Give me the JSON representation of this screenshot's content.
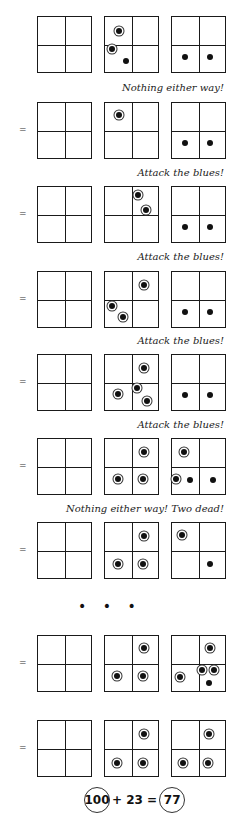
{
  "diagram": {
    "columns_x": [
      37,
      104,
      171
    ],
    "rows": [
      {
        "y": 16,
        "equals": false,
        "grids": [
          [],
          [
            {
              "x": 0.27,
              "y": 0.26,
              "type": "ringed"
            },
            {
              "x": 0.14,
              "y": 0.58,
              "type": "ringed"
            },
            {
              "x": 0.4,
              "y": 0.8,
              "type": "plain"
            }
          ],
          [
            {
              "x": 0.25,
              "y": 0.73,
              "type": "plain"
            },
            {
              "x": 0.72,
              "y": 0.73,
              "type": "plain"
            }
          ]
        ]
      },
      {
        "y": 102,
        "equals": true,
        "grids": [
          [],
          [
            {
              "x": 0.26,
              "y": 0.22,
              "type": "ringed"
            }
          ],
          [
            {
              "x": 0.25,
              "y": 0.73,
              "type": "plain"
            },
            {
              "x": 0.72,
              "y": 0.73,
              "type": "plain"
            }
          ]
        ]
      },
      {
        "y": 186,
        "equals": true,
        "grids": [
          [],
          [
            {
              "x": 0.62,
              "y": 0.15,
              "type": "ringed"
            },
            {
              "x": 0.78,
              "y": 0.42,
              "type": "ringed"
            }
          ],
          [
            {
              "x": 0.25,
              "y": 0.73,
              "type": "plain"
            },
            {
              "x": 0.72,
              "y": 0.73,
              "type": "plain"
            }
          ]
        ]
      },
      {
        "y": 271,
        "equals": true,
        "grids": [
          [],
          [
            {
              "x": 0.74,
              "y": 0.24,
              "type": "ringed"
            },
            {
              "x": 0.14,
              "y": 0.62,
              "type": "ringed"
            },
            {
              "x": 0.34,
              "y": 0.82,
              "type": "ringed"
            }
          ],
          [
            {
              "x": 0.25,
              "y": 0.73,
              "type": "plain"
            },
            {
              "x": 0.72,
              "y": 0.73,
              "type": "plain"
            }
          ]
        ]
      },
      {
        "y": 354,
        "equals": true,
        "grids": [
          [],
          [
            {
              "x": 0.74,
              "y": 0.24,
              "type": "ringed"
            },
            {
              "x": 0.24,
              "y": 0.7,
              "type": "ringed"
            },
            {
              "x": 0.6,
              "y": 0.6,
              "type": "ringed"
            },
            {
              "x": 0.8,
              "y": 0.84,
              "type": "ringed"
            }
          ],
          [
            {
              "x": 0.25,
              "y": 0.73,
              "type": "plain"
            },
            {
              "x": 0.72,
              "y": 0.73,
              "type": "plain"
            }
          ]
        ]
      },
      {
        "y": 438,
        "equals": true,
        "grids": [
          [],
          [
            {
              "x": 0.74,
              "y": 0.24,
              "type": "ringed"
            },
            {
              "x": 0.24,
              "y": 0.72,
              "type": "ringed"
            },
            {
              "x": 0.72,
              "y": 0.72,
              "type": "ringed"
            }
          ],
          [
            {
              "x": 0.22,
              "y": 0.24,
              "type": "ringed"
            },
            {
              "x": 0.08,
              "y": 0.72,
              "type": "ringed"
            },
            {
              "x": 0.34,
              "y": 0.74,
              "type": "plain"
            },
            {
              "x": 0.78,
              "y": 0.74,
              "type": "plain"
            }
          ]
        ]
      },
      {
        "y": 522,
        "equals": true,
        "grids": [
          [],
          [
            {
              "x": 0.74,
              "y": 0.24,
              "type": "ringed"
            },
            {
              "x": 0.24,
              "y": 0.74,
              "type": "ringed"
            },
            {
              "x": 0.72,
              "y": 0.74,
              "type": "ringed"
            }
          ],
          [
            {
              "x": 0.18,
              "y": 0.22,
              "type": "ringed"
            },
            {
              "x": 0.72,
              "y": 0.74,
              "type": "plain"
            }
          ]
        ]
      },
      {
        "y": 635,
        "equals": true,
        "grids": [
          [],
          [
            {
              "x": 0.74,
              "y": 0.22,
              "type": "ringed"
            },
            {
              "x": 0.22,
              "y": 0.72,
              "type": "ringed"
            },
            {
              "x": 0.72,
              "y": 0.72,
              "type": "ringed"
            }
          ],
          [
            {
              "x": 0.72,
              "y": 0.22,
              "type": "ringed"
            },
            {
              "x": 0.16,
              "y": 0.74,
              "type": "ringed"
            },
            {
              "x": 0.57,
              "y": 0.62,
              "type": "ringed"
            },
            {
              "x": 0.8,
              "y": 0.62,
              "type": "ringed"
            },
            {
              "x": 0.7,
              "y": 0.86,
              "type": "plain"
            }
          ]
        ]
      },
      {
        "y": 720,
        "equals": true,
        "grids": [
          [],
          [
            {
              "x": 0.74,
              "y": 0.24,
              "type": "ringed"
            },
            {
              "x": 0.22,
              "y": 0.76,
              "type": "ringed"
            },
            {
              "x": 0.72,
              "y": 0.76,
              "type": "ringed"
            }
          ],
          [
            {
              "x": 0.7,
              "y": 0.24,
              "type": "ringed"
            },
            {
              "x": 0.2,
              "y": 0.76,
              "type": "ringed"
            },
            {
              "x": 0.68,
              "y": 0.76,
              "type": "ringed"
            }
          ]
        ]
      }
    ],
    "equals_symbol": "=",
    "captions": [
      {
        "y": 82,
        "text": "Nothing either way!"
      },
      {
        "y": 167,
        "text": "Attack the blues!"
      },
      {
        "y": 251,
        "text": "Attack the blues!"
      },
      {
        "y": 335,
        "text": "Attack the blues!"
      },
      {
        "y": 419,
        "text": "Attack the blues!"
      },
      {
        "y": 503,
        "text": "Nothing either way!  Two dead!"
      }
    ],
    "ellipsis": "• • •",
    "formula": {
      "left": "100",
      "plus": "+ 23 =",
      "right": "77"
    }
  }
}
